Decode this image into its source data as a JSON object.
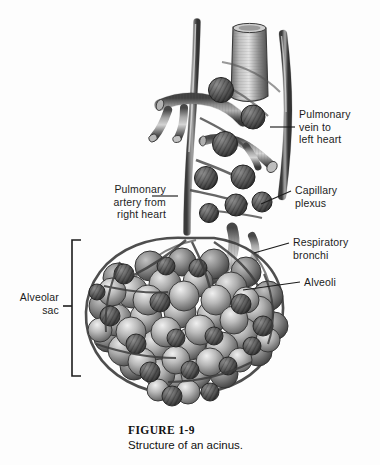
{
  "figure": {
    "number": "FIGURE 1-9",
    "title": "Structure of an acinus.",
    "background_color": "#fdfdfd",
    "ink_color": "#1c1c1c"
  },
  "labels": [
    {
      "id": "pulmonary-vein",
      "text": "Pulmonary\nvein to\nleft heart",
      "align": "left",
      "x": 299,
      "y": 108
    },
    {
      "id": "pulmonary-artery",
      "text": "Pulmonary\nartery from\nright heart",
      "align": "right",
      "x": 86,
      "y": 183
    },
    {
      "id": "capillary-plexus",
      "text": "Capillary\nplexus",
      "align": "left",
      "x": 295,
      "y": 184
    },
    {
      "id": "respiratory-bronchi",
      "text": "Respiratory\nbronchi",
      "align": "left",
      "x": 293,
      "y": 236
    },
    {
      "id": "alveoli",
      "text": "Alveoli",
      "align": "left",
      "x": 304,
      "y": 278
    },
    {
      "id": "alveolar-sac",
      "text": "Alveolar\nsac",
      "align": "right",
      "x": 11,
      "y": 291
    }
  ],
  "illustration": {
    "subject": "lung acinus",
    "description": "Grayscale anatomical drawing of a pulmonary acinus: a cut bronchus and pulmonary vessels at the top branching down into respiratory bronchioles that open into a large grape-like cluster of alveoli wrapped in capillary plexus knots.",
    "structures": [
      "bronchus",
      "pulmonary artery",
      "pulmonary vein",
      "capillary plexus",
      "respiratory bronchi",
      "alveoli",
      "alveolar sac"
    ],
    "palette": {
      "vessel_dark": "#4a4a4a",
      "vessel_mid": "#7d7d7d",
      "vessel_light": "#c9c9c9",
      "alveoli_light": "#d8d8d8",
      "alveoli_mid": "#9a9a9a",
      "alveoli_dark": "#5c5c5c",
      "plexus_dark": "#3b3b3b",
      "outline": "#2e2e2e"
    }
  },
  "leaders": [
    {
      "id": "leader-pulmonary-vein",
      "points": "270,127 295,127"
    },
    {
      "id": "leader-pulmonary-artery",
      "points": "178,196 152,196"
    },
    {
      "id": "leader-capillary-plexus",
      "points": "261,204 291,191"
    },
    {
      "id": "leader-respiratory-bronchi",
      "points": "254,253 289,243"
    },
    {
      "id": "leader-alveoli",
      "points": "243,290 300,282"
    }
  ],
  "bracket": {
    "id": "alveolar-sac-bracket",
    "x": 72,
    "top": 240,
    "bottom": 376,
    "arm": 9,
    "tick_y": 306,
    "tick_len": 9
  }
}
